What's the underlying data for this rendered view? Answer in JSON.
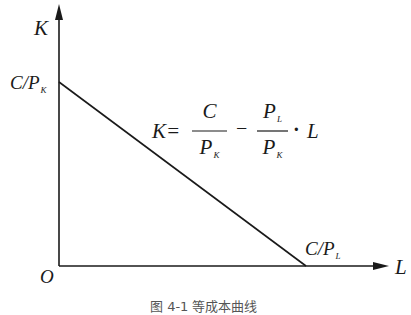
{
  "diagram": {
    "type": "isocost-line",
    "axes": {
      "y_label": "K",
      "x_label": "L",
      "origin_label": "O"
    },
    "intercepts": {
      "y": {
        "main": "C/P",
        "sub": "K"
      },
      "x": {
        "main": "C/P",
        "sub": "L"
      }
    },
    "equation": {
      "lhs": "K=",
      "frac1_num": "C",
      "frac1_den_main": "P",
      "frac1_den_sub": "K",
      "minus": "−",
      "frac2_num_main": "P",
      "frac2_num_sub": "L",
      "frac2_den_main": "P",
      "frac2_den_sub": "K",
      "times": "·",
      "variable": "L"
    },
    "caption": "图 4-1   等成本曲线",
    "colors": {
      "line": "#1a1a1a",
      "background": "#ffffff"
    }
  }
}
